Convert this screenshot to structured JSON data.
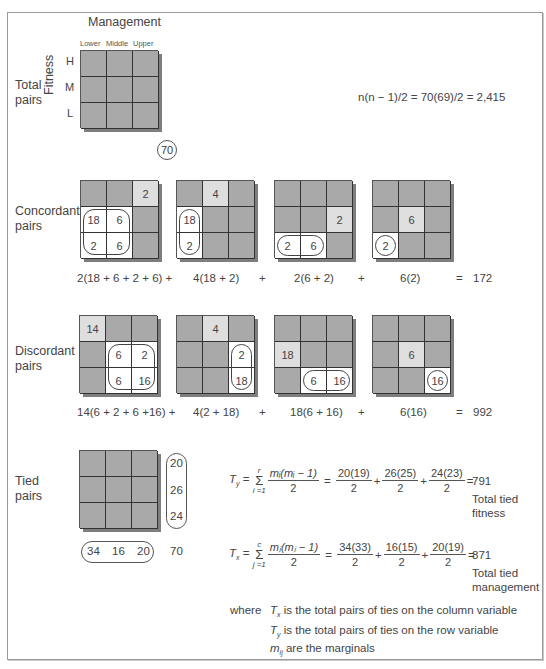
{
  "header": {
    "column_variable": "Management",
    "column_levels": [
      "Lower",
      "Middle",
      "Upper"
    ],
    "row_variable": "Fitness",
    "row_levels": [
      "H",
      "M",
      "L"
    ]
  },
  "total_pairs": {
    "label_line1": "Total",
    "label_line2": "pairs",
    "formula": "n(n − 1)/2 = 70(69)/2 =  2,415",
    "n": "70"
  },
  "concordant": {
    "label_line1": "Concordant",
    "label_line2": "pairs",
    "grids": [
      {
        "cells": [
          [
            "",
            "",
            "2"
          ],
          [
            "18",
            "6",
            ""
          ],
          [
            "2",
            "6",
            ""
          ]
        ]
      },
      {
        "cells": [
          [
            "",
            "4",
            ""
          ],
          [
            "18",
            "",
            ""
          ],
          [
            "2",
            "",
            ""
          ]
        ]
      },
      {
        "cells": [
          [
            "",
            "",
            ""
          ],
          [
            "",
            "",
            "2"
          ],
          [
            "2",
            "6",
            ""
          ]
        ]
      },
      {
        "cells": [
          [
            "",
            "",
            ""
          ],
          [
            "",
            "6",
            ""
          ],
          [
            "2",
            "",
            ""
          ]
        ]
      }
    ],
    "terms": [
      "2(18 + 6 + 2 + 6) +",
      "4(18 + 2)",
      "+",
      "2(6 + 2)",
      "+",
      "6(2)",
      "=",
      "172"
    ]
  },
  "discordant": {
    "label_line1": "Discordant",
    "label_line2": "pairs",
    "grids": [
      {
        "cells": [
          [
            "14",
            "",
            ""
          ],
          [
            "",
            "6",
            "2"
          ],
          [
            "",
            "6",
            "16"
          ]
        ]
      },
      {
        "cells": [
          [
            "",
            "4",
            ""
          ],
          [
            "",
            "",
            "2"
          ],
          [
            "",
            "",
            "18"
          ]
        ]
      },
      {
        "cells": [
          [
            "",
            "",
            ""
          ],
          [
            "18",
            "",
            ""
          ],
          [
            "",
            "6",
            "16"
          ]
        ]
      },
      {
        "cells": [
          [
            "",
            "",
            ""
          ],
          [
            "",
            "6",
            ""
          ],
          [
            "",
            "",
            "16"
          ]
        ]
      }
    ],
    "terms": [
      "14(6 + 2 + 6 +16) +",
      "4(2 + 18)",
      "+",
      "18(6 + 16)",
      "+",
      "6(16)",
      "=",
      "992"
    ]
  },
  "tied": {
    "label_line1": "Tied",
    "label_line2": "pairs",
    "row_marginals": [
      "20",
      "26",
      "24"
    ],
    "col_marginals": [
      "34",
      "16",
      "20"
    ],
    "total": "70",
    "ty": {
      "lhs": "T",
      "lhs_sub": "y",
      "sum_top": "r",
      "sum_bottom": "i =1",
      "num": "mᵢ(mᵢ − 1)",
      "den": "2",
      "fracs": [
        [
          "20(19)",
          "2"
        ],
        [
          "26(25)",
          "2"
        ],
        [
          "24(23)",
          "2"
        ]
      ],
      "result": "791",
      "caption_line1": "Total tied",
      "caption_line2": "fitness"
    },
    "tx": {
      "lhs": "T",
      "lhs_sub": "x",
      "sum_top": "c",
      "sum_bottom": "j =1",
      "num": "mⱼ(mⱼ − 1)",
      "den": "2",
      "fracs": [
        [
          "34(33)",
          "2"
        ],
        [
          "16(15)",
          "2"
        ],
        [
          "20(19)",
          "2"
        ]
      ],
      "result": "871",
      "caption_line1": "Total tied",
      "caption_line2": "management"
    }
  },
  "legend": {
    "where": "where",
    "lines": [
      {
        "sym": "T",
        "sub": "x",
        "text": " is the total pairs of ties on the column variable"
      },
      {
        "sym": "T",
        "sub": "y",
        "text": " is the total pairs of ties on the row variable"
      },
      {
        "sym": "m",
        "sub": "ij",
        "text": " are the marginals"
      }
    ]
  }
}
